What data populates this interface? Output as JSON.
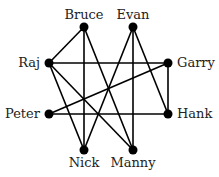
{
  "graph": {
    "nodes": [
      {
        "id": "Bruce",
        "label": "Bruce",
        "x": 84,
        "y": 27,
        "lx": 84,
        "ly": 19,
        "anchor": "middle"
      },
      {
        "id": "Evan",
        "label": "Evan",
        "x": 133,
        "y": 27,
        "lx": 133,
        "ly": 19,
        "anchor": "middle"
      },
      {
        "id": "Raj",
        "label": "Raj",
        "x": 49,
        "y": 63,
        "lx": 40,
        "ly": 67,
        "anchor": "end"
      },
      {
        "id": "Garry",
        "label": "Garry",
        "x": 168,
        "y": 63,
        "lx": 177,
        "ly": 67,
        "anchor": "start"
      },
      {
        "id": "Peter",
        "label": "Peter",
        "x": 49,
        "y": 114,
        "lx": 40,
        "ly": 118,
        "anchor": "end"
      },
      {
        "id": "Hank",
        "label": "Hank",
        "x": 168,
        "y": 114,
        "lx": 177,
        "ly": 118,
        "anchor": "start"
      },
      {
        "id": "Nick",
        "label": "Nick",
        "x": 84,
        "y": 150,
        "lx": 84,
        "ly": 167,
        "anchor": "middle"
      },
      {
        "id": "Manny",
        "label": "Manny",
        "x": 133,
        "y": 150,
        "lx": 133,
        "ly": 167,
        "anchor": "middle"
      }
    ],
    "edges": [
      [
        "Bruce",
        "Raj"
      ],
      [
        "Bruce",
        "Nick"
      ],
      [
        "Bruce",
        "Manny"
      ],
      [
        "Evan",
        "Nick"
      ],
      [
        "Evan",
        "Manny"
      ],
      [
        "Evan",
        "Hank"
      ],
      [
        "Raj",
        "Garry"
      ],
      [
        "Raj",
        "Nick"
      ],
      [
        "Raj",
        "Manny"
      ],
      [
        "Garry",
        "Peter"
      ],
      [
        "Garry",
        "Hank"
      ],
      [
        "Peter",
        "Hank"
      ]
    ],
    "colors": {
      "node": "#000000",
      "edge": "#000000",
      "label": "#222222"
    }
  }
}
